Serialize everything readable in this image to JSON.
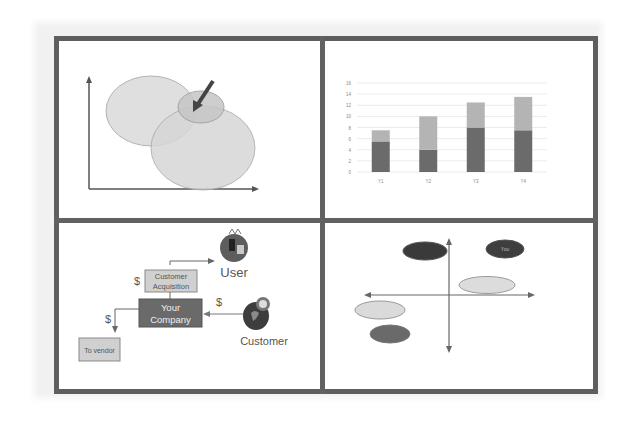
{
  "panels": {
    "venn": {
      "description": "overlapping-ellipses-with-pointer-arrow"
    },
    "bar_chart": {
      "y_ticks": [
        "0",
        "2",
        "4",
        "6",
        "8",
        "10",
        "12",
        "14",
        "16"
      ],
      "x_labels": [
        "Y1",
        "Y2",
        "Y3",
        "Y4"
      ]
    },
    "flow": {
      "user_label": "User",
      "customer_label": "Customer",
      "acquisition_line1": "Customer",
      "acquisition_line2": "Acquisition",
      "company_line1": "Your",
      "company_line2": "Company",
      "vendor_label": "To vendor",
      "dollar_acquisition": "$",
      "dollar_customer": "$",
      "dollar_vendor": "$"
    },
    "positioning": {
      "you_label": "You"
    }
  },
  "colors": {
    "frame": "#5e5e5e",
    "dark_bar": "#6b6b6b",
    "light_bar": "#b4b4b4",
    "company_box": "#6a6a6a",
    "light_box": "#d4d4d4",
    "ellipse_light": "#d9d9d9",
    "ellipse_dark": "#3c3c3c"
  },
  "chart_data": {
    "type": "bar",
    "stacked": true,
    "title": "",
    "xlabel": "",
    "ylabel": "",
    "categories": [
      "Y1",
      "Y2",
      "Y3",
      "Y4"
    ],
    "series": [
      {
        "name": "Series 1 (dark)",
        "values": [
          5.5,
          4,
          8,
          7.5
        ]
      },
      {
        "name": "Series 2 (light)",
        "values": [
          2,
          6,
          4.5,
          6
        ]
      }
    ],
    "ylim": [
      0,
      16
    ],
    "y_ticks": [
      0,
      2,
      4,
      6,
      8,
      10,
      12,
      14,
      16
    ],
    "grid": true,
    "legend": "none"
  }
}
